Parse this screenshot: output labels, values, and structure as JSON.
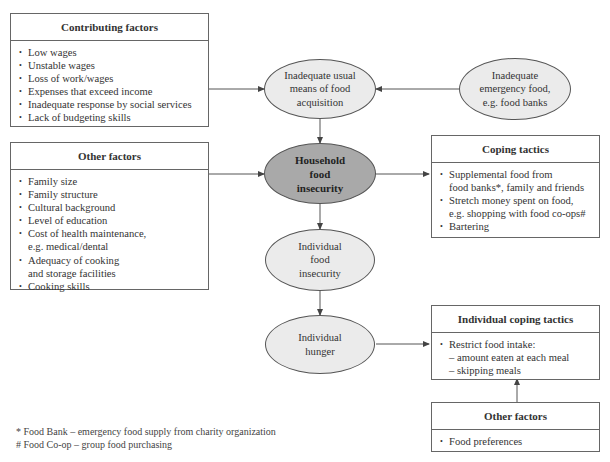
{
  "contributing_factors": {
    "title": "Contributing factors",
    "items": [
      "Low wages",
      "Unstable wages",
      "Loss of work/wages",
      "Expenses that exceed income",
      "Inadequate response by social services",
      "Lack of budgeting skills"
    ]
  },
  "other_factors": {
    "title": "Other factors",
    "items": [
      "Family size",
      "Family structure",
      "Cultural background",
      "Level of education",
      "Cost of health maintenance,",
      "e.g. medical/dental",
      "Adequacy of cooking",
      "and storage facilities",
      "Cooking skills"
    ]
  },
  "nodes": {
    "inadequate_usual": [
      "Inadequate usual",
      "means of food",
      "acquisition"
    ],
    "inadequate_emergency": [
      "Inadequate",
      "emergency food,",
      "e.g. food banks"
    ],
    "household": [
      "Household",
      "food",
      "insecurity"
    ],
    "individual_insecurity": [
      "Individual",
      "food",
      "insecurity"
    ],
    "individual_hunger": [
      "Individual",
      "hunger"
    ]
  },
  "coping_tactics": {
    "title": "Coping tactics",
    "items": [
      "Supplemental food from",
      "food banks*, family and friends",
      "Stretch money spent on food,",
      "e.g. shopping with food co-ops#",
      "Bartering"
    ]
  },
  "individual_coping": {
    "title": "Individual coping tactics",
    "item": "Restrict food intake:",
    "subitems": [
      "– amount eaten at each meal",
      "– skipping meals"
    ]
  },
  "other_factors_2": {
    "title": "Other factors",
    "items": [
      "Food preferences"
    ]
  },
  "footnotes": [
    "* Food Bank – emergency food supply from charity organization",
    "# Food Co-op – group food purchasing"
  ],
  "colors": {
    "ellipse_fill": "#ebebeb",
    "central_fill": "#a9a9a9",
    "line": "#555555"
  }
}
